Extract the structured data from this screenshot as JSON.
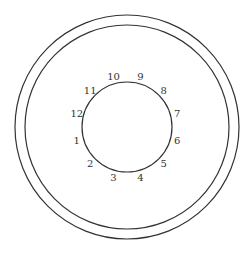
{
  "diagram": {
    "segments": [
      {
        "label": "1",
        "shaded": false
      },
      {
        "label": "2",
        "shaded": true
      },
      {
        "label": "3",
        "shaded": false
      },
      {
        "label": "4",
        "shaded": false
      },
      {
        "label": "5",
        "shaded": true
      },
      {
        "label": "6",
        "shaded": false
      },
      {
        "label": "7",
        "shaded": false
      },
      {
        "label": "8",
        "shaded": true
      },
      {
        "label": "9",
        "shaded": false
      },
      {
        "label": "10",
        "shaded": false
      },
      {
        "label": "11",
        "shaded": true
      },
      {
        "label": "12",
        "shaded": false
      }
    ],
    "colors": {
      "stroke": "#333333",
      "shade": "#cccccc",
      "background": "#ffffff"
    }
  }
}
